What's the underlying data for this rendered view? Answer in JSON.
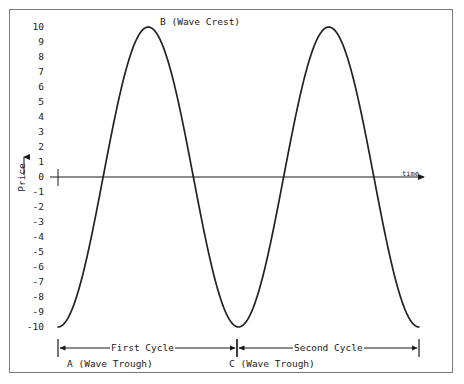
{
  "chart_data": {
    "type": "line",
    "title": "",
    "subtitle": "",
    "xlabel": "time",
    "ylabel": "Price",
    "ylim": [
      -10,
      10
    ],
    "xlim": [
      0,
      2
    ],
    "grid": false,
    "legend": null,
    "y_ticks": [
      "10",
      "9",
      "8",
      "7",
      "6",
      "5",
      "4",
      "3",
      "2",
      "1",
      "0",
      "-1",
      "-2",
      "-3",
      "-4",
      "-5",
      "-6",
      "-7",
      "-8",
      "-9",
      "-10"
    ],
    "x_ticks": [],
    "series": [
      {
        "name": "Price wave",
        "description": "Two full sinusoidal cycles of amplitude 10 beginning and ending at a trough",
        "amplitude": 10,
        "cycles": 2,
        "start_phase": "trough",
        "x": [
          0.0,
          0.0625,
          0.125,
          0.1875,
          0.25,
          0.3125,
          0.375,
          0.4375,
          0.5,
          0.5625,
          0.625,
          0.6875,
          0.75,
          0.8125,
          0.875,
          0.9375,
          1.0,
          1.0625,
          1.125,
          1.1875,
          1.25,
          1.3125,
          1.375,
          1.4375,
          1.5,
          1.5625,
          1.625,
          1.6875,
          1.75,
          1.8125,
          1.875,
          1.9375,
          2.0
        ],
        "values": [
          -10.0,
          -9.2,
          -7.1,
          -3.8,
          0.0,
          3.8,
          7.1,
          9.2,
          10.0,
          9.2,
          7.1,
          3.8,
          0.0,
          -3.8,
          -7.1,
          -9.2,
          -10.0,
          -9.2,
          -7.1,
          -3.8,
          0.0,
          3.8,
          7.1,
          9.2,
          10.0,
          9.2,
          7.1,
          3.8,
          0.0,
          -3.8,
          -7.1,
          -9.2,
          -10.0
        ]
      }
    ],
    "annotations": [
      {
        "id": "A",
        "label": "A (Wave Trough)",
        "x": 0.0,
        "y": -10
      },
      {
        "id": "B",
        "label": "B (Wave Crest)",
        "x": 0.5,
        "y": 10
      },
      {
        "id": "C",
        "label": "C (Wave Trough)",
        "x": 1.0,
        "y": -10
      }
    ],
    "spans": [
      {
        "label": "First Cycle",
        "from_x": 0.0,
        "to_x": 1.0
      },
      {
        "label": "Second Cycle",
        "from_x": 1.0,
        "to_x": 2.0
      }
    ],
    "colors": {
      "curve": "#222222",
      "axis": "#1a1a1a",
      "frame": "#7a7a7a",
      "background": "#ffffff",
      "text": "#1a1a1a"
    }
  }
}
